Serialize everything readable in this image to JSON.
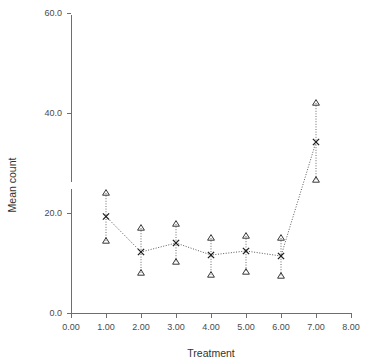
{
  "chart_data": {
    "type": "line",
    "title": "",
    "xlabel": "Treatment",
    "ylabel": "Mean count",
    "xlim": [
      0,
      8
    ],
    "ylim": [
      0,
      60
    ],
    "xticks": [
      "0.00",
      "1.00",
      "2.00",
      "3.00",
      "4.00",
      "5.00",
      "6.00",
      "7.00",
      "8.00"
    ],
    "xtick_values": [
      0,
      1,
      2,
      3,
      4,
      5,
      6,
      7,
      8
    ],
    "yticks": [
      "0.0",
      "20.0",
      "40.0",
      "60.0"
    ],
    "ytick_values": [
      0,
      20,
      40,
      60
    ],
    "grid": false,
    "legend": null,
    "x": [
      1,
      2,
      3,
      4,
      5,
      6,
      7
    ],
    "series": [
      {
        "name": "Mean count",
        "marker": "x",
        "linestyle": "dotted",
        "values": [
          19.3,
          12.2,
          14.0,
          11.6,
          12.4,
          11.4,
          34.2
        ]
      }
    ],
    "error_bars": {
      "marker": "triangle",
      "upper": [
        24.0,
        17.0,
        17.8,
        15.0,
        15.4,
        15.0,
        42.0
      ],
      "lower": [
        14.4,
        8.0,
        10.2,
        7.6,
        8.2,
        7.4,
        26.6
      ]
    },
    "axis_break_y": true,
    "colors": {
      "line": "#5a5a5a",
      "marker": "#1f1f1f",
      "axis": "#6e6e6e",
      "text": "#3a3a3a",
      "background": "#ffffff"
    }
  }
}
